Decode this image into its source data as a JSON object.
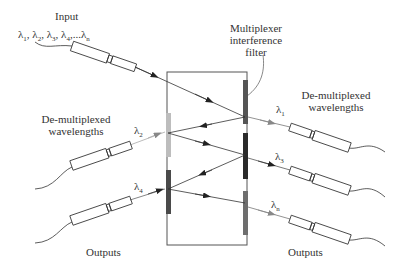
{
  "figure": {
    "labels": {
      "input_title": "Input",
      "input_wavelengths": "λ1, λ2, λ3, λ4,...λn",
      "filter_label_line1": "Multiplexer",
      "filter_label_line2": "interference",
      "filter_label_line3": "filter",
      "demux_left_line1": "De-multiplexed",
      "demux_left_line2": "wavelengths",
      "demux_right_line1": "De-multiplexed",
      "demux_right_line2": "wavelengths",
      "outputs_left": "Outputs",
      "outputs_right": "Outputs"
    },
    "wavelengths": [
      {
        "symbol": "λ",
        "sub": "1",
        "side": "right"
      },
      {
        "symbol": "λ",
        "sub": "2",
        "side": "left"
      },
      {
        "symbol": "λ",
        "sub": "3",
        "side": "right"
      },
      {
        "symbol": "λ",
        "sub": "4",
        "side": "left"
      },
      {
        "symbol": "λ",
        "sub": "n",
        "side": "right"
      }
    ],
    "input_wavelength_parts": [
      {
        "symbol": "λ",
        "sub": "1",
        "sep": ", "
      },
      {
        "symbol": "λ",
        "sub": "2",
        "sep": ", "
      },
      {
        "symbol": "λ",
        "sub": "3",
        "sep": ", "
      },
      {
        "symbol": "λ",
        "sub": "4",
        "sep": ",..."
      },
      {
        "symbol": "λ",
        "sub": "n",
        "sep": ""
      }
    ],
    "filter_colors": {
      "right_top": "#555555",
      "right_middle": "#2a2a2a",
      "right_bottom": "#6e6e6e",
      "left_top": "#bdbdbd",
      "left_bottom": "#4a4a4a"
    },
    "line_color": "#333333"
  }
}
